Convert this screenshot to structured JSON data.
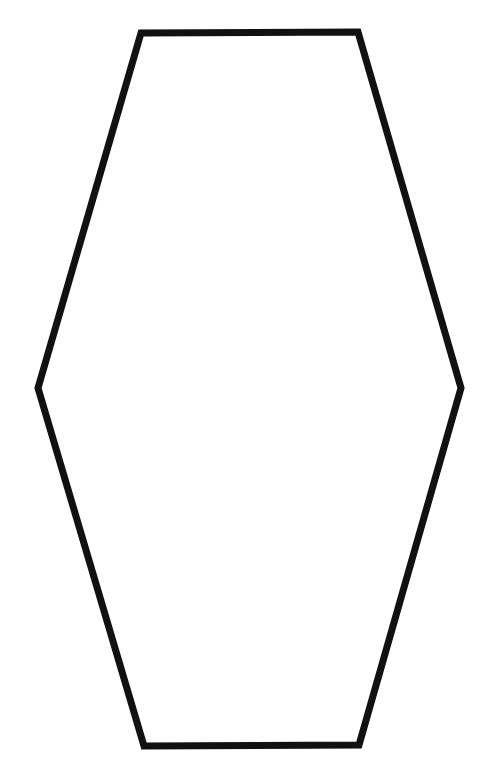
{
  "canvas": {
    "width": 483,
    "height": 779,
    "background_color": "#ffffff",
    "title": "Hexagon Outline"
  },
  "figure": {
    "name": "elongated-hexagon",
    "shape_type": "hexagon",
    "fill": "none",
    "fill_color": "#ffffff",
    "stroke_color": "#111111",
    "stroke_width": 7,
    "stroke_linejoin": "miter",
    "stroke_linecap": "butt",
    "vertex_count": 6,
    "vertices": [
      {
        "label": "top-left",
        "x": 141,
        "y": 33
      },
      {
        "label": "top-right",
        "x": 358,
        "y": 32
      },
      {
        "label": "middle-right",
        "x": 461,
        "y": 388
      },
      {
        "label": "bottom-right",
        "x": 359,
        "y": 745
      },
      {
        "label": "bottom-left",
        "x": 144,
        "y": 746
      },
      {
        "label": "middle-left",
        "x": 38,
        "y": 388
      }
    ],
    "points_attr": "141,33 358,32 461,388 359,745 144,746 38,388",
    "bounding_box": {
      "x": 38,
      "y": 32,
      "width": 423,
      "height": 714
    },
    "edges": [
      {
        "label": "top-edge",
        "from": "top-left",
        "to": "top-right"
      },
      {
        "label": "upper-right-edge",
        "from": "top-right",
        "to": "middle-right"
      },
      {
        "label": "lower-right-edge",
        "from": "middle-right",
        "to": "bottom-right"
      },
      {
        "label": "bottom-edge",
        "from": "bottom-right",
        "to": "bottom-left"
      },
      {
        "label": "lower-left-edge",
        "from": "bottom-left",
        "to": "middle-left"
      },
      {
        "label": "upper-left-edge",
        "from": "middle-left",
        "to": "top-left"
      }
    ]
  }
}
